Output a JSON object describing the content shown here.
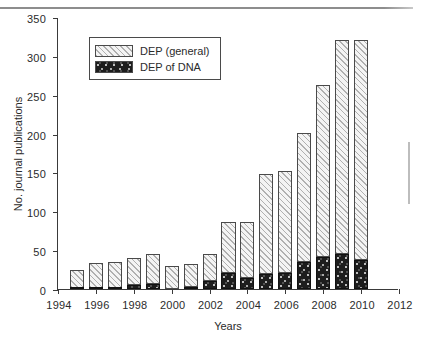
{
  "figure": {
    "background": "#ffffff",
    "axis_color": "#3a3a3a"
  },
  "legend": {
    "position": "top-left-inside",
    "entries": [
      {
        "label": "DEP (general)",
        "pattern": "diagonal-hatch",
        "color": "#f4f4f4"
      },
      {
        "label": "DEP of DNA",
        "pattern": "speckled-fill",
        "color": "#1d1d1d"
      }
    ]
  },
  "chart_data": {
    "type": "bar",
    "stacked": true,
    "title": "",
    "xlabel": "Years",
    "ylabel": "No. journal publications",
    "xlim": [
      1994,
      2012
    ],
    "ylim": [
      0,
      350
    ],
    "xticks": [
      1994,
      1996,
      1998,
      2000,
      2002,
      2004,
      2006,
      2008,
      2010,
      2012
    ],
    "yticks": [
      0,
      50,
      100,
      150,
      200,
      250,
      300,
      350
    ],
    "grid": false,
    "categories": [
      1995,
      1996,
      1997,
      1998,
      1999,
      2000,
      2001,
      2002,
      2003,
      2004,
      2005,
      2006,
      2007,
      2008,
      2009,
      2010
    ],
    "series": [
      {
        "name": "DEP of DNA",
        "values": [
          1,
          1,
          1,
          5,
          6,
          0,
          3,
          10,
          20,
          14,
          19,
          20,
          35,
          41,
          45,
          37
        ]
      },
      {
        "name": "DEP (general)",
        "values": [
          23,
          32,
          34,
          35,
          39,
          30,
          29,
          35,
          66,
          72,
          129,
          132,
          166,
          222,
          275,
          284
        ]
      }
    ],
    "totals": [
      24,
      33,
      35,
      40,
      45,
      30,
      32,
      45,
      86,
      86,
      148,
      152,
      201,
      263,
      320,
      321
    ]
  }
}
